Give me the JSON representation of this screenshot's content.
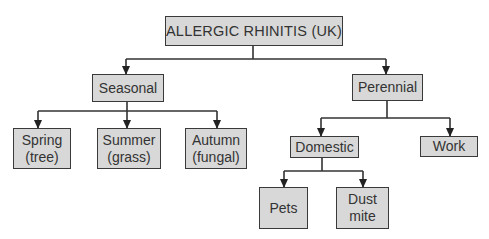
{
  "diagram": {
    "type": "tree",
    "colors": {
      "box_fill": "#d8d8d8",
      "box_border": "#3a3a3a",
      "text": "#333333",
      "connector": "#333333"
    },
    "root": {
      "label": "ALLERGIC  RHINITIS (UK)"
    },
    "nodes": {
      "seasonal": {
        "label": "Seasonal"
      },
      "perennial": {
        "label": "Perennial"
      },
      "spring": {
        "label": "Spring\n(tree)"
      },
      "summer": {
        "label": "Summer\n(grass)"
      },
      "autumn": {
        "label": "Autumn\n(fungal)"
      },
      "domestic": {
        "label": "Domestic"
      },
      "work": {
        "label": "Work"
      },
      "pets": {
        "label": "Pets"
      },
      "dust_mite": {
        "label": "Dust\nmite"
      }
    },
    "edges": [
      [
        "ALLERGIC RHINITIS (UK)",
        "Seasonal"
      ],
      [
        "ALLERGIC RHINITIS (UK)",
        "Perennial"
      ],
      [
        "Seasonal",
        "Spring (tree)"
      ],
      [
        "Seasonal",
        "Summer (grass)"
      ],
      [
        "Seasonal",
        "Autumn (fungal)"
      ],
      [
        "Perennial",
        "Domestic"
      ],
      [
        "Perennial",
        "Work"
      ],
      [
        "Domestic",
        "Pets"
      ],
      [
        "Domestic",
        "Dust mite"
      ]
    ]
  }
}
